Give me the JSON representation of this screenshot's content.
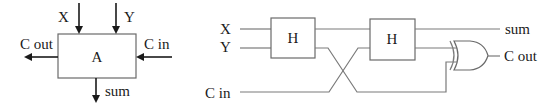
{
  "block_diagram": {
    "block_label": "A",
    "inputs": {
      "x": "X",
      "y": "Y",
      "carry_in": "C in"
    },
    "outputs": {
      "carry_out": "C out",
      "sum": "sum"
    }
  },
  "circuit_diagram": {
    "inputs": {
      "x": "X",
      "y": "Y",
      "carry_in": "C in"
    },
    "half_adders": [
      {
        "label": "H"
      },
      {
        "label": "H"
      }
    ],
    "gate": {
      "type": "OR"
    },
    "outputs": {
      "sum": "sum",
      "carry_out": "C out"
    }
  },
  "colors": {
    "wire": "#7a7a7a",
    "arrow": "#1a1a1a",
    "text": "#1a1a1a",
    "background": "#ffffff"
  }
}
